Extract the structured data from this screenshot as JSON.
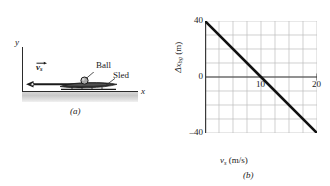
{
  "figure": {
    "panel_a": {
      "caption": "(a)",
      "y_axis_label": "y",
      "x_axis_label": "x",
      "velocity_symbol": "v",
      "velocity_subscript": "s",
      "ball_label": "Ball",
      "sled_label": "Sled",
      "ground_color": "#d2d2d2",
      "line_color": "#2b2b2b"
    },
    "panel_b": {
      "caption": "(b)"
    }
  },
  "chart_data": {
    "type": "line",
    "title": "",
    "xlabel": "v_s (m/s)",
    "xlabel_symbol": "v",
    "xlabel_subscript": "s",
    "xlabel_unit": " (m/s)",
    "ylabel": "Δx_bg (m)",
    "ylabel_symbol": "Δx",
    "ylabel_subscript": "bg",
    "ylabel_unit": " (m)",
    "x": [
      0,
      20
    ],
    "values": [
      40,
      -40
    ],
    "series": [
      {
        "name": "Δx_bg vs v_s",
        "points": [
          [
            0,
            40
          ],
          [
            10,
            0
          ],
          [
            20,
            -40
          ]
        ]
      }
    ],
    "xlim": [
      0,
      20
    ],
    "ylim": [
      -40,
      40
    ],
    "xticks": [
      10,
      20
    ],
    "xtick_labels": [
      "10",
      "20"
    ],
    "yticks": [
      40,
      0,
      -40
    ],
    "ytick_labels": [
      "40",
      "0",
      "–40"
    ],
    "grid": true,
    "grid_x_divisions": 8,
    "grid_y_divisions": 8,
    "grid_color": "#b9b9b9",
    "line_color": "#111111",
    "axis_color": "#3a3a3a",
    "legend": "none",
    "slope": -4,
    "intercept": 40,
    "zero_crossing": 10
  }
}
